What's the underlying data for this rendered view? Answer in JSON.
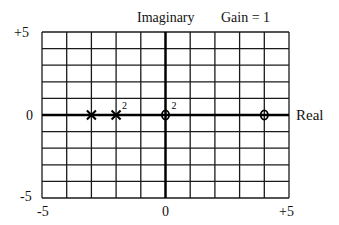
{
  "chart_data": {
    "type": "scatter",
    "title": "Imaginary",
    "subtitle": "Gain = 1",
    "xlabel": "Real",
    "ylabel": "Imaginary",
    "xlim": [
      -5,
      5
    ],
    "ylim": [
      -5,
      5
    ],
    "grid": true,
    "grid_step": 1,
    "x_ticks": [
      "-5",
      "0",
      "+5"
    ],
    "y_ticks": [
      "+5",
      "0",
      "-5"
    ],
    "series": [
      {
        "name": "poles",
        "marker": "x",
        "points": [
          {
            "x": -3,
            "y": 0,
            "multiplicity": 1,
            "label": ""
          },
          {
            "x": -2,
            "y": 0,
            "multiplicity": 2,
            "label": "2"
          }
        ]
      },
      {
        "name": "zeros",
        "marker": "o",
        "points": [
          {
            "x": 0,
            "y": 0,
            "multiplicity": 2,
            "label": "2"
          },
          {
            "x": 4,
            "y": 0,
            "multiplicity": 1,
            "label": ""
          }
        ]
      }
    ],
    "gain": 1
  },
  "labels": {
    "title": "Imaginary",
    "gain": "Gain = 1",
    "real_axis": "Real",
    "y_top": "+5",
    "y_mid": "0",
    "y_bot": "-5",
    "x_left": "-5",
    "x_mid": "0",
    "x_right": "+5"
  },
  "colors": {
    "grid": "#1a1a1a",
    "axis": "#000000",
    "marker": "#000000",
    "background": "#ffffff"
  }
}
